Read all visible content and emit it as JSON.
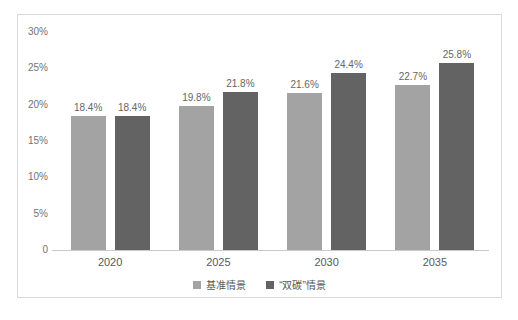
{
  "chart_data": {
    "type": "bar",
    "title": "",
    "categories": [
      "2020",
      "2025",
      "2030",
      "2035"
    ],
    "series": [
      {
        "name": "基准情景",
        "color": "#a3a3a3",
        "values": [
          18.4,
          19.8,
          21.6,
          22.7
        ],
        "labels": [
          "18.4%",
          "19.8%",
          "21.6%",
          "22.7%"
        ]
      },
      {
        "name": "“双碳”情景",
        "color": "#636363",
        "values": [
          18.4,
          21.8,
          24.4,
          25.8
        ],
        "labels": [
          "18.4%",
          "21.8%",
          "24.4%",
          "25.8%"
        ]
      }
    ],
    "xlabel": "",
    "ylabel": "",
    "ylim": [
      0,
      30
    ],
    "yticks": {
      "values": [
        30,
        25,
        20,
        15,
        10,
        5,
        0
      ],
      "labels": [
        "30%",
        "25%",
        "20%",
        "15%",
        "10%",
        "5%",
        "0"
      ]
    },
    "grid": false,
    "legend_position": "bottom",
    "colors": {
      "frame_border": "#d9d9d9",
      "axis_line": "#c9c9c9",
      "tick_text": "#737373",
      "label_text": "#666666",
      "background": "#ffffff"
    }
  }
}
